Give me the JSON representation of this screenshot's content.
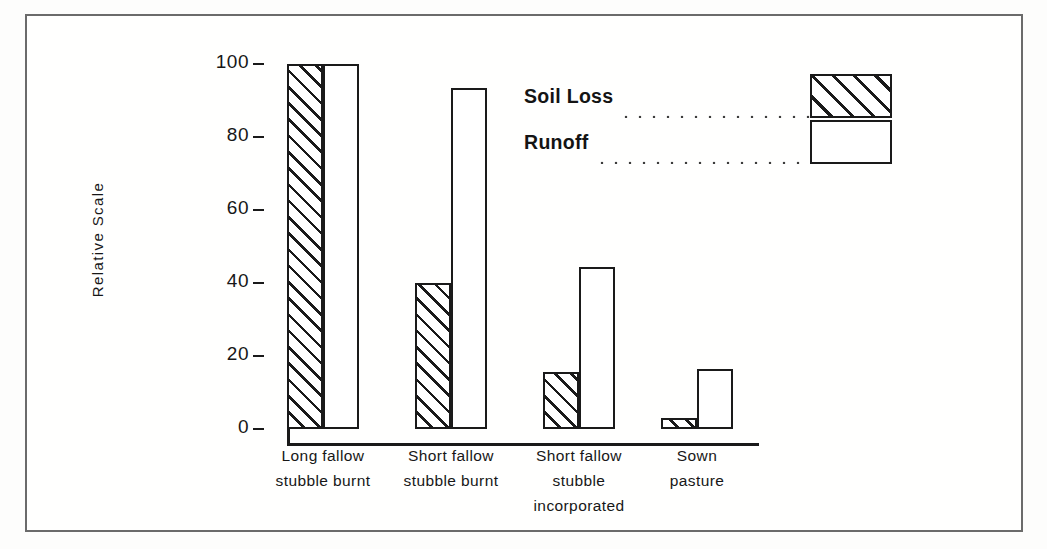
{
  "chart_data": {
    "type": "bar",
    "title": "",
    "xlabel": "",
    "ylabel": "Relative Scale",
    "ylim": [
      0,
      100
    ],
    "yticks": [
      0,
      20,
      40,
      60,
      80,
      100
    ],
    "ytick_labels": [
      "0",
      "20",
      "40",
      "60",
      "80",
      "100"
    ],
    "grid": false,
    "legend_position": "upper-right",
    "categories": [
      "Long fallow stubble burnt",
      "Short fallow stubble burnt",
      "Short fallow stubble incorporated",
      "Sown pasture"
    ],
    "category_lines": [
      [
        "Long fallow",
        "stubble burnt"
      ],
      [
        "Short fallow",
        "stubble burnt"
      ],
      [
        "Short fallow",
        "stubble",
        "incorporated"
      ],
      [
        "Sown",
        "pasture"
      ]
    ],
    "series": [
      {
        "name": "Soil Loss",
        "pattern": "hatched",
        "values": [
          100,
          40,
          15.5,
          3
        ]
      },
      {
        "name": "Runoff",
        "pattern": "open",
        "values": [
          100,
          93.5,
          44.5,
          16.5
        ]
      }
    ]
  },
  "legend": {
    "items": [
      {
        "label": "Soil Loss",
        "pattern": "hatched"
      },
      {
        "label": "Runoff",
        "pattern": "open"
      }
    ]
  },
  "colors": {
    "ink": "#1a1a1a",
    "frame": "#6b6b6b",
    "background": "#ffffff"
  }
}
